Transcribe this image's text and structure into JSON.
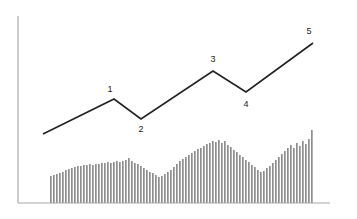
{
  "figure": {
    "name": "elliott-wave-impulse-chart",
    "background_color": "#ffffff",
    "width": 357,
    "height": 219
  },
  "colors": {
    "axis": "#a8a8a8",
    "wave_line": "#222222",
    "bar": "#8e8e8e",
    "label_text": "#1a1a1a",
    "background": "#ffffff"
  },
  "chart_data": {
    "type": "line",
    "title": "",
    "subtitle": "",
    "xlabel": "",
    "ylabel": "",
    "grid": false,
    "legend_position": "none",
    "axes": {
      "y_axis": {
        "x": 18,
        "y_top": 16,
        "y_bottom": 203
      },
      "x_axis": {
        "y": 203,
        "x_left": 18,
        "x_right": 330
      },
      "xlim": [
        0,
        357
      ],
      "ylim": [
        0,
        219
      ]
    },
    "annotations": [
      {
        "label": "1",
        "x": 110,
        "y": 92,
        "point_x": 114,
        "point_y": 99,
        "position": "above"
      },
      {
        "label": "2",
        "x": 141,
        "y": 132,
        "point_x": 141,
        "point_y": 119,
        "position": "below"
      },
      {
        "label": "3",
        "x": 213,
        "y": 62,
        "point_x": 213,
        "point_y": 71,
        "position": "above"
      },
      {
        "label": "4",
        "x": 246,
        "y": 107,
        "point_x": 246,
        "point_y": 92,
        "position": "below"
      },
      {
        "label": "5",
        "x": 309,
        "y": 34,
        "point_x": 313,
        "point_y": 43,
        "position": "above"
      }
    ],
    "series": [
      {
        "name": "impulse-wave",
        "type": "line",
        "color": "#222222",
        "width": 1.6,
        "points": [
          {
            "x": 43,
            "y": 134,
            "label": ""
          },
          {
            "x": 114,
            "y": 99,
            "label": "1"
          },
          {
            "x": 141,
            "y": 119,
            "label": "2"
          },
          {
            "x": 213,
            "y": 71,
            "label": "3"
          },
          {
            "x": 246,
            "y": 92,
            "label": "4"
          },
          {
            "x": 313,
            "y": 43,
            "label": "5"
          }
        ]
      },
      {
        "name": "volume-bars",
        "type": "bar",
        "color": "#8e8e8e",
        "baseline_y": 203,
        "bar_width": 1.7,
        "pitch": 3.0,
        "start_x": 50,
        "tops": [
          176,
          175,
          174,
          173,
          172,
          170,
          169,
          168,
          167,
          166,
          166,
          165,
          165,
          164,
          165,
          164,
          164,
          163,
          163,
          162,
          163,
          162,
          161,
          162,
          161,
          160,
          158,
          161,
          163,
          164,
          166,
          168,
          170,
          172,
          173,
          175,
          177,
          176,
          174,
          172,
          170,
          167,
          164,
          161,
          159,
          157,
          155,
          153,
          151,
          149,
          148,
          146,
          144,
          143,
          141,
          142,
          140,
          143,
          141,
          145,
          147,
          150,
          152,
          155,
          157,
          160,
          162,
          165,
          167,
          170,
          172,
          171,
          168,
          166,
          163,
          160,
          157,
          154,
          151,
          148,
          145,
          148,
          143,
          146,
          141,
          144,
          139,
          130
        ]
      }
    ]
  },
  "labels": {
    "wave_1": "1",
    "wave_2": "2",
    "wave_3": "3",
    "wave_4": "4",
    "wave_5": "5"
  }
}
